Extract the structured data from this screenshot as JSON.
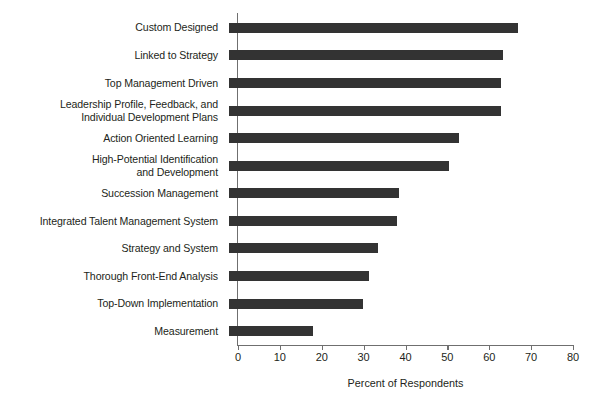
{
  "chart_data": {
    "type": "bar",
    "orientation": "horizontal",
    "title": "",
    "subtitle": "",
    "xlabel": "Percent of Respondents",
    "ylabel": "",
    "xlim": [
      0,
      80
    ],
    "xticks": [
      0,
      10,
      20,
      30,
      40,
      50,
      60,
      70,
      80
    ],
    "xtick_labels": [
      "0",
      "10",
      "20",
      "30",
      "40",
      "50",
      "60",
      "70",
      "80"
    ],
    "grid": false,
    "legend": null,
    "bar_color": "#333333",
    "axis_color": "#6f6f6f",
    "categories": [
      "Custom Designed",
      "Linked to Strategy",
      "Top Management Driven",
      "Leadership Profile, Feedback, and\nIndividual Development Plans",
      "Action Oriented Learning",
      "High-Potential Identification\nand Development",
      "Succession Management",
      "Integrated Talent Management System",
      "Strategy and System",
      "Thorough Front-End Analysis",
      "Top-Down Implementation",
      "Measurement"
    ],
    "values": [
      69,
      65.5,
      65,
      65,
      55,
      52.5,
      40.5,
      40,
      35.5,
      33.5,
      32,
      20
    ]
  }
}
